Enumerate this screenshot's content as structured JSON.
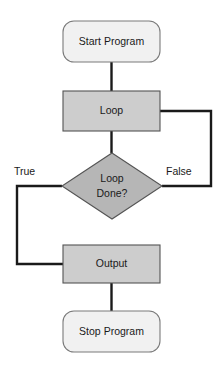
{
  "diagram": {
    "type": "flowchart",
    "canvas": {
      "width": 221,
      "height": 369,
      "background": "#ffffff"
    },
    "colors": {
      "terminator_fill": "#f1f1f1",
      "terminator_stroke": "#7a7a7a",
      "process_fill": "#cdcdcd",
      "process_stroke": "#545454",
      "decision_fill": "#b6b6b6",
      "decision_stroke": "#545454",
      "connector": "#1a1a1a",
      "text": "#1a1a1a"
    },
    "nodes": [
      {
        "id": "start",
        "shape": "terminator",
        "label": "Start Program",
        "x": 63,
        "y": 21,
        "width": 97,
        "height": 41,
        "center_x": 111.5,
        "center_y": 41.5
      },
      {
        "id": "loop",
        "shape": "process",
        "label": "Loop",
        "x": 63,
        "y": 91,
        "width": 97,
        "height": 40,
        "center_x": 111.5,
        "center_y": 111
      },
      {
        "id": "decision",
        "shape": "decision",
        "label_line1": "Loop",
        "label_line2": "Done?",
        "center_x": 112,
        "center_y": 186,
        "half_width": 50,
        "half_height": 33
      },
      {
        "id": "output",
        "shape": "process",
        "label": "Output",
        "x": 63,
        "y": 245,
        "width": 97,
        "height": 38,
        "center_x": 111.5,
        "center_y": 264
      },
      {
        "id": "stop",
        "shape": "terminator",
        "label": "Stop Program",
        "x": 63,
        "y": 311,
        "width": 97,
        "height": 41,
        "center_x": 111.5,
        "center_y": 331.5
      }
    ],
    "edges": [
      {
        "id": "start-to-loop",
        "from": "start",
        "to": "loop",
        "path": "M 111.5 62 L 111.5 91"
      },
      {
        "id": "loop-to-decision",
        "from": "loop",
        "to": "decision",
        "path": "M 111.5 131 L 111.5 153"
      },
      {
        "id": "decision-false-to-loop",
        "from": "decision",
        "to": "loop",
        "label": "False",
        "path": "M 162 186 L 211 186 L 211 111 L 160 111"
      },
      {
        "id": "decision-true-to-output",
        "from": "decision",
        "to": "output",
        "label": "True",
        "path": "M 62 186 L 17 186 L 17 264 L 63 264"
      },
      {
        "id": "output-to-stop",
        "from": "output",
        "to": "stop",
        "path": "M 111.5 283 L 111.5 311"
      }
    ],
    "edge_labels": [
      {
        "id": "label-true",
        "text": "True",
        "x": 14,
        "y": 172
      },
      {
        "id": "label-false",
        "text": "False",
        "x": 166,
        "y": 172
      }
    ]
  }
}
